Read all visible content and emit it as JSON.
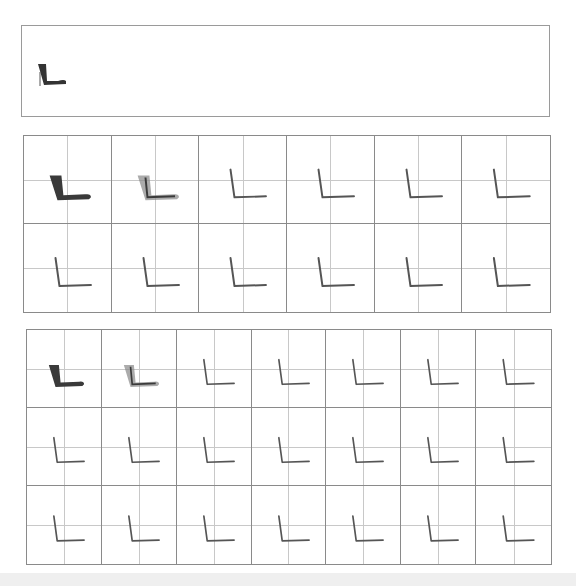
{
  "worksheet": {
    "character": "L",
    "stroke_color": "#3a3a3a",
    "grid_line_color": "#8a8a8a",
    "guide_line_color": "#c8c8c8"
  },
  "demo": {
    "glyph": "L",
    "arrow_hint": "stroke-direction-arrow"
  },
  "grid1": {
    "rows": 2,
    "cols": 6,
    "cells": [
      {
        "style": "bold"
      },
      {
        "style": "trace"
      },
      {
        "style": "thin"
      },
      {
        "style": "thin"
      },
      {
        "style": "thin"
      },
      {
        "style": "thin"
      },
      {
        "style": "thin"
      },
      {
        "style": "thin"
      },
      {
        "style": "thin"
      },
      {
        "style": "thin"
      },
      {
        "style": "thin"
      },
      {
        "style": "thin"
      }
    ]
  },
  "grid2": {
    "rows": 3,
    "cols": 7,
    "cells": [
      {
        "style": "bold"
      },
      {
        "style": "trace"
      },
      {
        "style": "thin"
      },
      {
        "style": "thin"
      },
      {
        "style": "thin"
      },
      {
        "style": "thin"
      },
      {
        "style": "thin"
      },
      {
        "style": "thin"
      },
      {
        "style": "thin"
      },
      {
        "style": "thin"
      },
      {
        "style": "thin"
      },
      {
        "style": "thin"
      },
      {
        "style": "thin"
      },
      {
        "style": "thin"
      },
      {
        "style": "thin"
      },
      {
        "style": "thin"
      },
      {
        "style": "thin"
      },
      {
        "style": "thin"
      },
      {
        "style": "thin"
      },
      {
        "style": "thin"
      },
      {
        "style": "thin"
      }
    ]
  }
}
